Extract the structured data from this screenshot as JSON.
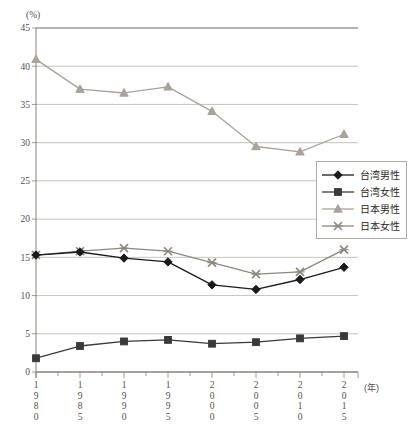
{
  "chart_data": {
    "type": "line",
    "title": "",
    "xlabel": "(年)",
    "ylabel": "(%)",
    "ylim": [
      0,
      45
    ],
    "ytick_step": 5,
    "grid": true,
    "legend_position": "right-middle",
    "categories": [
      "1980",
      "1985",
      "1990",
      "1995",
      "2000",
      "2005",
      "2010",
      "2015"
    ],
    "yticks": [
      "0",
      "5",
      "10",
      "15",
      "20",
      "25",
      "30",
      "35",
      "40",
      "45"
    ],
    "series": [
      {
        "name": "台湾男性",
        "marker": "diamond",
        "color": "#1a1a1a",
        "values": [
          15.3,
          15.7,
          14.9,
          14.4,
          11.4,
          10.8,
          12.1,
          13.7
        ]
      },
      {
        "name": "台湾女性",
        "marker": "square",
        "color": "#3a3a3a",
        "values": [
          1.8,
          3.4,
          4.0,
          4.2,
          3.7,
          3.9,
          4.4,
          4.7
        ]
      },
      {
        "name": "日本男性",
        "marker": "triangle",
        "color": "#a9a399",
        "values": [
          40.9,
          37.0,
          36.5,
          37.3,
          34.1,
          29.5,
          28.8,
          31.1
        ]
      },
      {
        "name": "日本女性",
        "marker": "cross",
        "color": "#8d877e",
        "values": [
          15.3,
          15.8,
          16.2,
          15.8,
          14.3,
          12.8,
          13.1,
          16.0
        ]
      }
    ]
  },
  "legend": {
    "items": [
      {
        "label": "台湾男性"
      },
      {
        "label": "台湾女性"
      },
      {
        "label": "日本男性"
      },
      {
        "label": "日本女性"
      }
    ]
  },
  "axes": {
    "y_unit": "(%)",
    "x_unit": "(年)"
  }
}
